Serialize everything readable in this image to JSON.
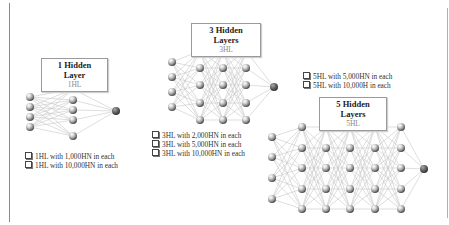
{
  "colors": {
    "node_light": "#d8d8d8",
    "node_dark": "#555555",
    "output_node": "#6a6a6a",
    "edge": "#c8c8c8",
    "border": "#8a8a8a"
  },
  "panels": [
    {
      "title": "1 Hidden Layer",
      "subtitle": "1HL",
      "options": [
        "1HL with 1,000HN in each",
        "1HL with 10,000HN in each"
      ],
      "network": {
        "layers": [
          {
            "x": 30,
            "ys": [
              97,
              107,
              117,
              127
            ]
          },
          {
            "x": 73,
            "ys": [
              89,
              100,
              110,
              120,
              136
            ]
          },
          {
            "x": 116,
            "ys": [
              111
            ],
            "output": true
          }
        ]
      }
    },
    {
      "title": "3 Hidden Layers",
      "subtitle": "3HL",
      "options": [
        "3HL with 2,000HN in each",
        "3HL with 5,000HN in each",
        "3HL with 10,000HN in each"
      ],
      "network": {
        "layers": [
          {
            "x": 172,
            "ys": [
              62,
              77,
              92,
              107
            ]
          },
          {
            "x": 200,
            "ys": [
              51,
              68,
              85,
              103,
              120
            ]
          },
          {
            "x": 223,
            "ys": [
              51,
              68,
              85,
              103,
              120
            ]
          },
          {
            "x": 246,
            "ys": [
              51,
              68,
              85,
              103,
              120
            ]
          },
          {
            "x": 274,
            "ys": [
              87
            ],
            "output": true
          }
        ]
      }
    },
    {
      "title": "5 Hidden Layers",
      "subtitle": "5HL",
      "options": [
        "5HL with 5,000HN in each",
        "5HL with 10,000H in each"
      ],
      "network": {
        "layers": [
          {
            "x": 272,
            "ys": [
              137,
              157,
              178,
              199
            ]
          },
          {
            "x": 302,
            "ys": [
              127,
              148,
              168,
              189,
              209
            ]
          },
          {
            "x": 326,
            "ys": [
              127,
              148,
              168,
              189,
              209
            ]
          },
          {
            "x": 350,
            "ys": [
              127,
              148,
              168,
              189,
              209
            ]
          },
          {
            "x": 375,
            "ys": [
              127,
              148,
              168,
              189,
              209
            ]
          },
          {
            "x": 401,
            "ys": [
              127,
              148,
              168,
              189,
              209
            ]
          },
          {
            "x": 424,
            "ys": [
              169
            ],
            "output": true
          }
        ]
      }
    }
  ]
}
